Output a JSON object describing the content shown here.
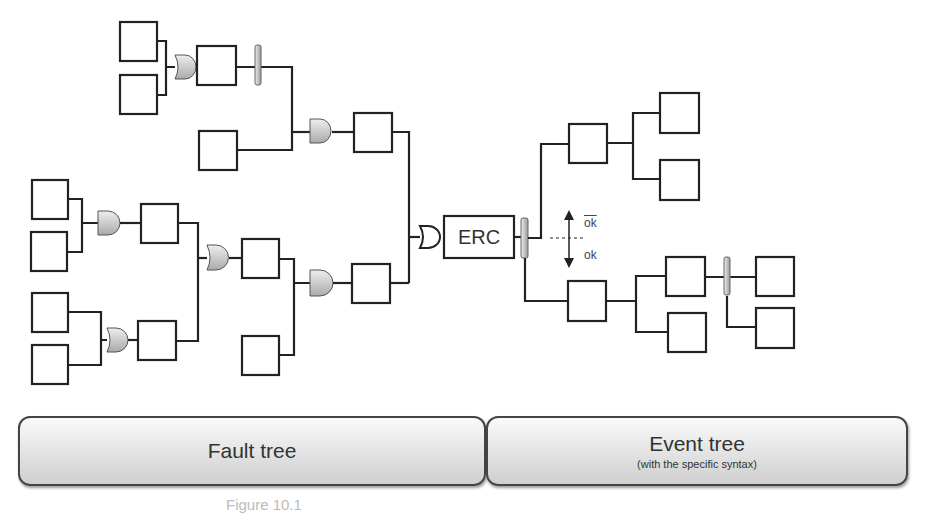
{
  "diagram": {
    "central_node": "ERC",
    "branch_labels": {
      "upper": "ok̅",
      "lower": "ok"
    },
    "sections": [
      {
        "title": "Fault tree",
        "subtitle": ""
      },
      {
        "title": "Event tree",
        "subtitle": "(with the specific syntax)"
      }
    ],
    "caption": "Figure 10.1"
  }
}
